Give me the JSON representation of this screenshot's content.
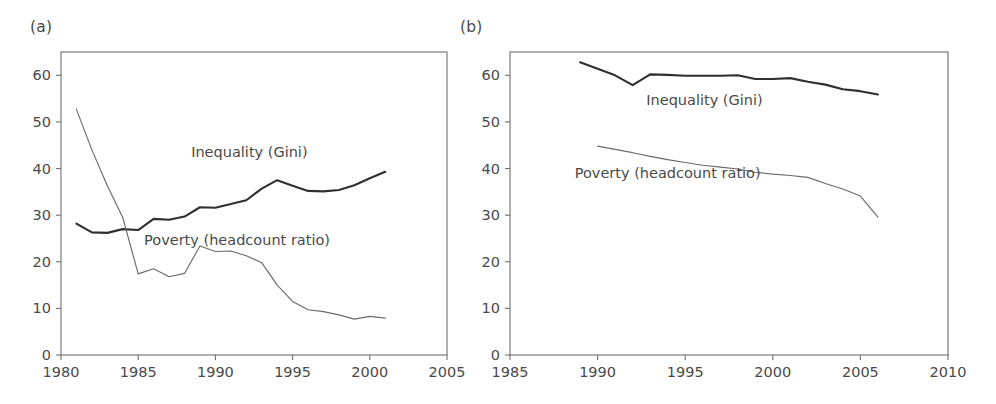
{
  "figure": {
    "panel_a_label": "(a)",
    "panel_b_label": "(b)"
  },
  "chart_data": [
    {
      "type": "line",
      "panel": "(a)",
      "title": "",
      "xlabel": "",
      "ylabel": "",
      "xlim": [
        1980,
        2005
      ],
      "ylim": [
        0,
        65
      ],
      "xticks": [
        1980,
        1985,
        1990,
        1995,
        2000,
        2005
      ],
      "xtick_labels": [
        "1980",
        "1985",
        "1990",
        "1995",
        "2000",
        "2005"
      ],
      "yticks": [
        0,
        10,
        20,
        30,
        40,
        50,
        60
      ],
      "ytick_labels": [
        "0",
        "10",
        "20",
        "30",
        "40",
        "50",
        "60"
      ],
      "grid": false,
      "legend": "inline-annotations",
      "annotations": [
        {
          "text": "Inequality (Gini)",
          "x": 1992.2,
          "y": 42.5
        },
        {
          "text": "Poverty (headcount ratio)",
          "x": 1991.4,
          "y": 23.6
        }
      ],
      "series": [
        {
          "name": "Inequality (Gini)",
          "x": [
            1981,
            1982,
            1983,
            1984,
            1985,
            1986,
            1987,
            1988,
            1989,
            1990,
            1991,
            1992,
            1993,
            1994,
            1995,
            1996,
            1997,
            1998,
            1999,
            2000,
            2001
          ],
          "values": [
            28.2,
            26.3,
            26.2,
            27.0,
            26.8,
            29.2,
            29.0,
            29.7,
            31.7,
            31.6,
            32.4,
            33.2,
            35.7,
            37.5,
            36.3,
            35.2,
            35.1,
            35.4,
            36.4,
            37.9,
            39.3
          ]
        },
        {
          "name": "Poverty (headcount ratio)",
          "x": [
            1981,
            1982,
            1983,
            1984,
            1985,
            1986,
            1987,
            1988,
            1989,
            1990,
            1991,
            1992,
            1993,
            1994,
            1995,
            1996,
            1997,
            1998,
            1999,
            2000,
            2001
          ],
          "values": [
            52.7,
            44.0,
            36.3,
            29.5,
            17.4,
            18.5,
            16.8,
            17.5,
            23.4,
            22.2,
            22.3,
            21.3,
            19.8,
            15.0,
            11.5,
            9.7,
            9.3,
            8.6,
            7.7,
            8.3,
            7.9
          ]
        }
      ]
    },
    {
      "type": "line",
      "panel": "(b)",
      "title": "",
      "xlabel": "",
      "ylabel": "",
      "xlim": [
        1985,
        2010
      ],
      "ylim": [
        0,
        65
      ],
      "xticks": [
        1985,
        1990,
        1995,
        2000,
        2005,
        2010
      ],
      "xtick_labels": [
        "1985",
        "1990",
        "1995",
        "2000",
        "2005",
        "2010"
      ],
      "yticks": [
        0,
        10,
        20,
        30,
        40,
        50,
        60
      ],
      "ytick_labels": [
        "0",
        "10",
        "20",
        "30",
        "40",
        "50",
        "60"
      ],
      "grid": false,
      "legend": "inline-annotations",
      "annotations": [
        {
          "text": "Inequality (Gini)",
          "x": 1996.1,
          "y": 53.7
        },
        {
          "text": "Poverty (headcount ratio)",
          "x": 1994.0,
          "y": 38.0
        }
      ],
      "series": [
        {
          "name": "Inequality (Gini)",
          "x": [
            1989,
            1990,
            1991,
            1992,
            1993,
            1994,
            1995,
            1996,
            1997,
            1998,
            1999,
            2000,
            2001,
            2002,
            2003,
            2004,
            2005,
            2006
          ],
          "values": [
            62.8,
            61.4,
            60.0,
            57.9,
            60.2,
            60.1,
            59.9,
            59.9,
            59.9,
            60.0,
            59.2,
            59.2,
            59.4,
            58.6,
            58.0,
            57.0,
            56.6,
            55.9
          ]
        },
        {
          "name": "Poverty (headcount ratio)",
          "x": [
            1990,
            1991,
            1992,
            1993,
            1994,
            1995,
            1996,
            1997,
            1998,
            1999,
            2000,
            2001,
            2002,
            2003,
            2004,
            2005,
            2006
          ],
          "values": [
            44.8,
            44.1,
            43.4,
            42.6,
            41.9,
            41.3,
            40.7,
            40.3,
            39.9,
            39.2,
            38.8,
            38.5,
            38.1,
            36.8,
            35.6,
            34.1,
            29.6
          ]
        }
      ]
    }
  ],
  "style": {
    "gini_color": "#2f2f2f",
    "poverty_color": "#6a6a6a",
    "axis_color": "#6e6e6e",
    "text_color": "#4a4a4a",
    "background": "#ffffff"
  }
}
